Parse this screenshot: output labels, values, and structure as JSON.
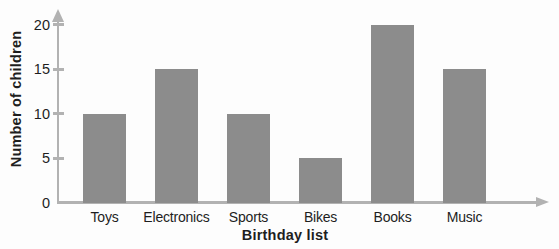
{
  "chart_data": {
    "type": "bar",
    "categories": [
      "Toys",
      "Electronics",
      "Sports",
      "Bikes",
      "Books",
      "Music"
    ],
    "values": [
      10,
      15,
      10,
      5,
      20,
      15
    ],
    "xlabel": "Birthday list",
    "ylabel": "Number of children",
    "ylim": [
      0,
      20
    ],
    "yticks": [
      0,
      5,
      10,
      15,
      20
    ],
    "grid": false,
    "legend": false,
    "bar_color": "#8c8c8c",
    "axis_color": "#b2b2b2",
    "text_color": "#1e1e1e",
    "background_color": "#fdfdfd"
  }
}
